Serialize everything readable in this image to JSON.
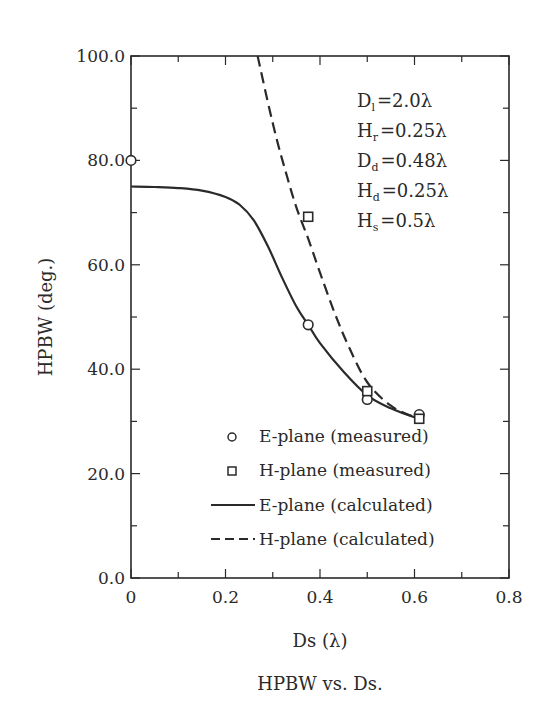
{
  "chart_data": {
    "type": "line",
    "title": "HPBW vs. Ds.",
    "xlabel": "Ds (λ)",
    "ylabel": "HPBW (deg.)",
    "xlim": [
      0,
      0.8
    ],
    "ylim": [
      0,
      100
    ],
    "grid": false,
    "x_ticks": [
      "0",
      "0.2",
      "0.4",
      "0.6",
      "0.8"
    ],
    "x_tick_values": [
      0,
      0.2,
      0.4,
      0.6,
      0.8
    ],
    "x_minor_ticks": [
      0.1,
      0.3,
      0.5,
      0.7
    ],
    "y_ticks": [
      "0.0",
      "20.0",
      "40.0",
      "60.0",
      "80.0",
      "100.0"
    ],
    "y_tick_values": [
      0,
      20,
      40,
      60,
      80,
      100
    ],
    "y_minor_ticks": [
      10,
      30,
      50,
      70,
      90
    ],
    "legend_position": "lower-center-inside",
    "parameters": [
      {
        "symbol": "D",
        "sub": "l",
        "value": "=2.0λ"
      },
      {
        "symbol": "H",
        "sub": "r",
        "value": "=0.25λ"
      },
      {
        "symbol": "D",
        "sub": "d",
        "value": "=0.48λ"
      },
      {
        "symbol": "H",
        "sub": "d",
        "value": "=0.25λ"
      },
      {
        "symbol": "H",
        "sub": "s",
        "value": "=0.5λ"
      }
    ],
    "series": [
      {
        "name": "E-plane (measured)",
        "style": "marker-circle",
        "x": [
          0.0,
          0.375,
          0.5,
          0.61
        ],
        "y": [
          80.0,
          48.5,
          34.2,
          31.3
        ]
      },
      {
        "name": "H-plane (measured)",
        "style": "marker-square",
        "x": [
          0.375,
          0.5,
          0.61
        ],
        "y": [
          69.2,
          35.8,
          30.5
        ]
      },
      {
        "name": "E-plane (calculated)",
        "style": "solid",
        "x": [
          0.0,
          0.05,
          0.1,
          0.15,
          0.2,
          0.23,
          0.26,
          0.29,
          0.32,
          0.35,
          0.375,
          0.4,
          0.45,
          0.5,
          0.55,
          0.6,
          0.62
        ],
        "y": [
          75.0,
          74.9,
          74.7,
          74.2,
          73.0,
          71.5,
          68.5,
          63.5,
          57.5,
          52.0,
          48.5,
          45.0,
          39.5,
          35.0,
          32.5,
          30.8,
          30.5
        ]
      },
      {
        "name": "H-plane (calculated)",
        "style": "dashed",
        "x": [
          0.268,
          0.29,
          0.31,
          0.33,
          0.35,
          0.375,
          0.4,
          0.43,
          0.46,
          0.5,
          0.55,
          0.6,
          0.62
        ],
        "y": [
          100.0,
          91.0,
          83.5,
          77.0,
          71.0,
          65.0,
          58.5,
          51.0,
          44.5,
          37.5,
          33.0,
          30.8,
          30.3
        ]
      }
    ]
  }
}
